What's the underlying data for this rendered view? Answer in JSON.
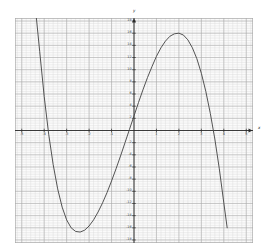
{
  "chart_data": {
    "type": "line",
    "title": "",
    "xlabel": "x",
    "ylabel": "y",
    "xlim": [
      -5.3,
      5.3
    ],
    "ylim": [
      -18.5,
      18.5
    ],
    "grid": true,
    "grid_minor_step_x": 0.2,
    "grid_minor_step_y": 0.4,
    "grid_major_step_x": 1,
    "grid_major_step_y": 2,
    "legend": "none",
    "x_tick_labels": [
      "-5",
      "-4",
      "-3",
      "-2",
      "-1",
      "0",
      "1",
      "2",
      "3",
      "4",
      "5"
    ],
    "x_tick_values": [
      -5,
      -4,
      -3,
      -2,
      -1,
      0,
      1,
      2,
      3,
      4,
      5
    ],
    "y_tick_labels": [
      "-18",
      "-16",
      "-14",
      "-12",
      "-10",
      "-8",
      "-6",
      "-4",
      "-2",
      "2",
      "4",
      "6",
      "8",
      "10",
      "12",
      "14",
      "16",
      "18"
    ],
    "y_tick_values": [
      -18,
      -16,
      -14,
      -12,
      -10,
      -8,
      -6,
      -4,
      -2,
      2,
      4,
      6,
      8,
      10,
      12,
      14,
      16,
      18
    ],
    "series": [
      {
        "name": "cubic",
        "color": "#4a4a4a",
        "roots": [
          -4,
          0,
          3.7
        ],
        "local_minimum": [
          -2,
          -16
        ],
        "local_maximum": [
          2,
          16
        ],
        "x": [
          -4.35,
          -4.2,
          -4.0,
          -3.8,
          -3.6,
          -3.4,
          -3.2,
          -3.0,
          -2.8,
          -2.6,
          -2.4,
          -2.2,
          -2.0,
          -1.8,
          -1.6,
          -1.4,
          -1.2,
          -1.0,
          -0.8,
          -0.6,
          -0.4,
          -0.2,
          0.0,
          0.2,
          0.4,
          0.6,
          0.8,
          1.0,
          1.2,
          1.4,
          1.6,
          1.8,
          2.0,
          2.2,
          2.4,
          2.6,
          2.8,
          3.0,
          3.2,
          3.4,
          3.6,
          3.8,
          4.0,
          4.15
        ],
        "y": [
          18.6,
          13.0,
          5.6,
          -0.6,
          -5.6,
          -9.6,
          -12.6,
          -14.7,
          -16.0,
          -16.6,
          -16.7,
          -16.4,
          -15.7,
          -14.7,
          -13.4,
          -11.9,
          -10.2,
          -8.3,
          -6.3,
          -4.2,
          -2.0,
          0.2,
          2.4,
          4.6,
          6.7,
          8.7,
          10.5,
          12.2,
          13.6,
          14.7,
          15.5,
          15.9,
          16.0,
          15.7,
          14.9,
          13.6,
          11.8,
          9.4,
          6.4,
          2.8,
          -1.4,
          -6.3,
          -11.9,
          -16.0
        ]
      }
    ]
  },
  "axes": {
    "x_axis_label": "x",
    "y_axis_label": "y"
  },
  "colors": {
    "curve": "#4a4a4a",
    "axis": "#2a2a2a",
    "grid_minor": "#d9d9d9",
    "grid_major": "#a8a8a8",
    "background": "#fbfbfb"
  }
}
